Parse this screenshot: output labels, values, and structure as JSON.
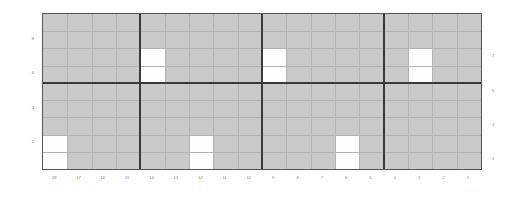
{
  "chart_data": {
    "type": "heatmap",
    "title": "",
    "xlabel": "",
    "ylabel": "",
    "grid": true,
    "legend": null,
    "columns": 18,
    "rows": 9,
    "x_tick_labels": [
      "18",
      "17",
      "16",
      "15",
      "14",
      "13",
      "12",
      "11",
      "10",
      "9",
      "8",
      "7",
      "6",
      "5",
      "4",
      "3",
      "2",
      "1"
    ],
    "y_tick_labels_left": [
      "8",
      "6",
      "4",
      "2"
    ],
    "y_tick_labels_right": [
      "7",
      "5",
      "3",
      "1"
    ],
    "y_left_rows": [
      1,
      3,
      5,
      7
    ],
    "y_right_rows": [
      2,
      4,
      6,
      8
    ],
    "column_separators": [
      4,
      9,
      14
    ],
    "row_separators": [
      4
    ],
    "background_value": 0,
    "highlight_value": 1,
    "colors": {
      "background_cell": "#c9c9c9",
      "highlight_cell": "#fdfdfd",
      "thin_gridline": "#b3b3b3",
      "separator": "#3a3a3a",
      "border": "#555555",
      "tick_label": "#777777",
      "page_background": "#ffffff"
    },
    "highlighted_cells": [
      {
        "col": 4,
        "row": 2,
        "x_label": "14",
        "y_label": "6"
      },
      {
        "col": 4,
        "row": 3,
        "x_label": "14",
        "y_label": "5"
      },
      {
        "col": 0,
        "row": 7,
        "x_label": "18",
        "y_label": "2"
      },
      {
        "col": 0,
        "row": 8,
        "x_label": "18",
        "y_label": "1"
      },
      {
        "col": 6,
        "row": 7,
        "x_label": "12",
        "y_label": "2"
      },
      {
        "col": 6,
        "row": 8,
        "x_label": "12",
        "y_label": "1"
      },
      {
        "col": 9,
        "row": 2,
        "x_label": "9",
        "y_label": "6"
      },
      {
        "col": 9,
        "row": 3,
        "x_label": "9",
        "y_label": "5"
      },
      {
        "col": 12,
        "row": 7,
        "x_label": "6",
        "y_label": "2"
      },
      {
        "col": 12,
        "row": 8,
        "x_label": "6",
        "y_label": "1"
      },
      {
        "col": 15,
        "row": 2,
        "x_label": "3",
        "y_label": "6"
      },
      {
        "col": 15,
        "row": 3,
        "x_label": "3",
        "y_label": "5"
      }
    ]
  }
}
